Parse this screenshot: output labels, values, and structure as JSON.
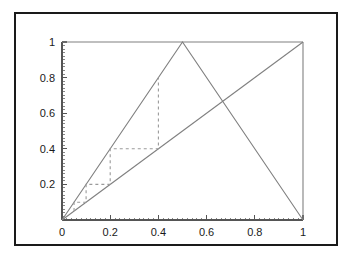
{
  "figure": {
    "background_color": "#ffffff",
    "frame_color": "#1a1a1a",
    "curve_color": "#808080",
    "dash_color": "#9a9a9a",
    "axis_color": "#555555",
    "label_color": "#1a1a1a"
  },
  "chart_data": {
    "type": "line",
    "title": "",
    "xlabel": "",
    "ylabel": "",
    "xlim": [
      0,
      1
    ],
    "ylim": [
      0,
      1
    ],
    "grid": false,
    "legend": "none",
    "xticks": [
      0,
      0.2,
      0.4,
      0.6,
      0.8,
      1
    ],
    "xtick_labels": [
      "0",
      "0.2",
      "0.4",
      "0.6",
      "0.8",
      "1"
    ],
    "yticks": [
      0.2,
      0.4,
      0.6,
      0.8,
      1
    ],
    "ytick_labels": [
      "0.2",
      "0.4",
      "0.6",
      "0.8",
      "1"
    ],
    "minor_ticks": true,
    "series": [
      {
        "name": "tent-map",
        "style": "solid",
        "x": [
          0,
          0.5,
          1
        ],
        "y": [
          0,
          1,
          0
        ]
      },
      {
        "name": "identity-line",
        "style": "solid",
        "x": [
          0,
          1
        ],
        "y": [
          0,
          1
        ]
      },
      {
        "name": "plot-top-border",
        "style": "solid",
        "x": [
          0,
          1
        ],
        "y": [
          1,
          1
        ]
      },
      {
        "name": "plot-right-border",
        "style": "solid",
        "x": [
          1,
          1
        ],
        "y": [
          0,
          1
        ]
      },
      {
        "name": "cobweb-staircase",
        "style": "dashed",
        "x": [
          0.05,
          0.05,
          0.1,
          0.1,
          0.2,
          0.2,
          0.4,
          0.4
        ],
        "y": [
          0.05,
          0.1,
          0.1,
          0.2,
          0.2,
          0.4,
          0.4,
          0.8
        ]
      }
    ],
    "annotations": []
  }
}
